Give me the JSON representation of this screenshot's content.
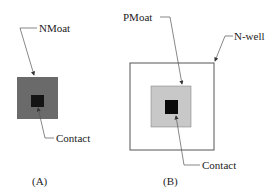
{
  "figure_a": {
    "caption": "(A)",
    "labels": {
      "moat": "NMoat",
      "contact": "Contact"
    },
    "colors": {
      "moat": "#6a6a6a",
      "contact": "#141414"
    }
  },
  "figure_b": {
    "caption": "(B)",
    "labels": {
      "moat": "PMoat",
      "well": "N-well",
      "contact": "Contact"
    },
    "colors": {
      "well_fill": "#ffffff",
      "well_stroke": "#555555",
      "moat": "#c8c8c8",
      "contact": "#0a0a0a"
    }
  }
}
